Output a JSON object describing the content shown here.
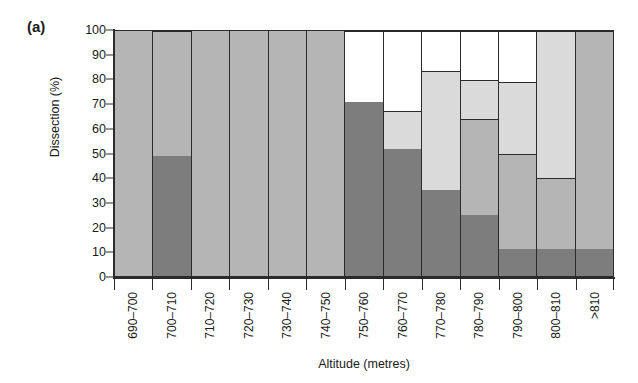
{
  "figure": {
    "panel_letter": "(a)"
  },
  "chart_data": {
    "type": "bar",
    "subtype": "stacked-bar-100pct",
    "title": "",
    "panel_label": "(a)",
    "xlabel": "Altitude (metres)",
    "ylabel": "Dissection (%)",
    "ylim": [
      0,
      100
    ],
    "yticks": [
      0,
      10,
      20,
      30,
      40,
      50,
      60,
      70,
      80,
      90,
      100
    ],
    "ytick_labels": [
      "0",
      "10",
      "20",
      "30",
      "40",
      "50",
      "60",
      "70",
      "80",
      "90",
      "100"
    ],
    "grid": false,
    "legend": "none",
    "categories": [
      "690–700",
      "700–710",
      "710–720",
      "720–730",
      "730–740",
      "740–750",
      "750–760",
      "760–770",
      "770–780",
      "780–790",
      "790–800",
      "800–810",
      ">810"
    ],
    "series": [
      {
        "name": "class-1-dark",
        "color": "#7d7d7d",
        "values": [
          0,
          49,
          0,
          0,
          0,
          0,
          71,
          52,
          35,
          25,
          11,
          11,
          11
        ]
      },
      {
        "name": "class-2-medium",
        "color": "#b5b5b5",
        "values": [
          100,
          51,
          100,
          100,
          100,
          100,
          0,
          0,
          0,
          39,
          39,
          29,
          89
        ]
      },
      {
        "name": "class-3-light",
        "color": "#dadada",
        "values": [
          0,
          0,
          0,
          0,
          0,
          0,
          0,
          15.5,
          48.5,
          16,
          29,
          60,
          0
        ]
      },
      {
        "name": "class-4-white",
        "color": "#ffffff",
        "values": [
          0,
          0,
          0,
          0,
          0,
          0,
          29,
          32.5,
          16.5,
          20,
          21,
          0,
          0
        ]
      }
    ],
    "bars": [
      {
        "category": "690–700",
        "segments": [
          {
            "class": "class-2-medium",
            "from": 0,
            "to": 100
          }
        ]
      },
      {
        "category": "700–710",
        "segments": [
          {
            "class": "class-1-dark",
            "from": 0,
            "to": 49
          },
          {
            "class": "class-2-medium",
            "from": 49,
            "to": 100
          }
        ]
      },
      {
        "category": "710–720",
        "segments": [
          {
            "class": "class-2-medium",
            "from": 0,
            "to": 100
          }
        ]
      },
      {
        "category": "720–730",
        "segments": [
          {
            "class": "class-2-medium",
            "from": 0,
            "to": 100
          }
        ]
      },
      {
        "category": "730–740",
        "segments": [
          {
            "class": "class-2-medium",
            "from": 0,
            "to": 100
          }
        ]
      },
      {
        "category": "740–750",
        "segments": [
          {
            "class": "class-2-medium",
            "from": 0,
            "to": 100
          }
        ]
      },
      {
        "category": "750–760",
        "segments": [
          {
            "class": "class-1-dark",
            "from": 0,
            "to": 71
          },
          {
            "class": "class-4-white",
            "from": 71,
            "to": 100
          }
        ]
      },
      {
        "category": "760–770",
        "segments": [
          {
            "class": "class-1-dark",
            "from": 0,
            "to": 52
          },
          {
            "class": "class-3-light",
            "from": 52,
            "to": 67.5
          },
          {
            "class": "class-4-white",
            "from": 67.5,
            "to": 100
          }
        ]
      },
      {
        "category": "770–780",
        "segments": [
          {
            "class": "class-1-dark",
            "from": 0,
            "to": 35
          },
          {
            "class": "class-3-light",
            "from": 35,
            "to": 83.5
          },
          {
            "class": "class-4-white",
            "from": 83.5,
            "to": 100
          }
        ]
      },
      {
        "category": "780–790",
        "segments": [
          {
            "class": "class-1-dark",
            "from": 0,
            "to": 25
          },
          {
            "class": "class-2-medium",
            "from": 25,
            "to": 64
          },
          {
            "class": "class-3-light",
            "from": 64,
            "to": 80
          },
          {
            "class": "class-4-white",
            "from": 80,
            "to": 100
          }
        ]
      },
      {
        "category": "790–800",
        "segments": [
          {
            "class": "class-1-dark",
            "from": 0,
            "to": 11
          },
          {
            "class": "class-2-medium",
            "from": 11,
            "to": 50
          },
          {
            "class": "class-3-light",
            "from": 50,
            "to": 79
          },
          {
            "class": "class-4-white",
            "from": 79,
            "to": 100
          }
        ]
      },
      {
        "category": "800–810",
        "segments": [
          {
            "class": "class-1-dark",
            "from": 0,
            "to": 11
          },
          {
            "class": "class-2-medium",
            "from": 11,
            "to": 40
          },
          {
            "class": "class-3-light",
            "from": 40,
            "to": 100
          }
        ]
      },
      {
        "category": ">810",
        "segments": [
          {
            "class": "class-1-dark",
            "from": 0,
            "to": 11
          },
          {
            "class": "class-2-medium",
            "from": 11,
            "to": 100
          }
        ]
      }
    ],
    "colors": {
      "class-1-dark": "#7d7d7d",
      "class-2-medium": "#b5b5b5",
      "class-3-light": "#dadada",
      "class-4-white": "#ffffff",
      "axis": "#2b2b2b",
      "text": "#1a1a1a",
      "background": "#ffffff"
    }
  }
}
